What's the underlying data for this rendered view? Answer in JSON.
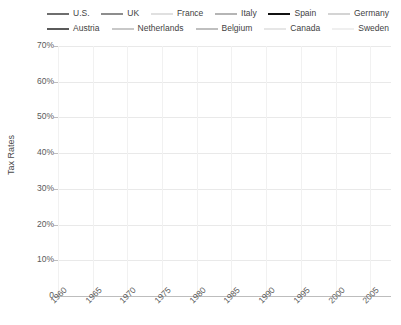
{
  "chart_data": {
    "type": "line",
    "title": "",
    "xlabel": "",
    "ylabel": "Tax Rates",
    "xlim": [
      1960,
      2008
    ],
    "ylim": [
      0,
      70
    ],
    "grid": true,
    "legend_position": "top",
    "ytick_labels": [
      "70%",
      "60%",
      "50%",
      "40%",
      "30%",
      "20%",
      "10%",
      "0"
    ],
    "ytick_values": [
      70,
      60,
      50,
      40,
      30,
      20,
      10,
      0
    ],
    "xtick_labels": [
      "1960",
      "1965",
      "1970",
      "1975",
      "1980",
      "1985",
      "1990",
      "1995",
      "2000",
      "2005"
    ],
    "xtick_values": [
      1960,
      1965,
      1970,
      1975,
      1980,
      1985,
      1990,
      1995,
      2000,
      2005
    ],
    "x": [
      1960,
      1961,
      1962,
      1963,
      1964,
      1965,
      1966,
      1967,
      1968,
      1969,
      1970,
      1971,
      1972,
      1973,
      1974,
      1975,
      1976,
      1977,
      1978,
      1979,
      1980,
      1981,
      1982,
      1983,
      1984,
      1985,
      1986,
      1987,
      1988,
      1989,
      1990,
      1991,
      1992,
      1993,
      1994,
      1995,
      1996,
      1997,
      1998,
      1999,
      2000,
      2001,
      2002,
      2003,
      2004,
      2005,
      2006,
      2007
    ],
    "series": [
      {
        "name": "U.S.",
        "color": "#6e6e6e",
        "width": 2.0,
        "values": [
          26.5,
          26.8,
          26.6,
          26.4,
          25.1,
          24.7,
          25.4,
          25.8,
          27.4,
          28.9,
          27.8,
          26.8,
          27.6,
          27.7,
          28.2,
          26.4,
          27.0,
          27.4,
          27.2,
          27.6,
          27.3,
          27.9,
          27.0,
          25.9,
          25.7,
          26.0,
          25.9,
          27.0,
          26.8,
          27.0,
          27.0,
          27.0,
          26.8,
          27.3,
          27.6,
          27.8,
          28.4,
          28.8,
          29.2,
          29.5,
          29.5,
          28.4,
          26.1,
          25.2,
          25.5,
          26.9,
          27.8,
          27.9
        ]
      },
      {
        "name": "UK",
        "color": "#8d8d8d",
        "width": 2.0,
        "values": [
          28.5,
          28.8,
          29.5,
          28.4,
          28.7,
          30.1,
          31.5,
          33.3,
          34.3,
          36.7,
          37.0,
          35.3,
          34.1,
          33.3,
          35.0,
          35.2,
          35.0,
          34.8,
          33.0,
          33.0,
          35.1,
          36.5,
          38.3,
          37.6,
          37.6,
          37.2,
          37.1,
          36.6,
          36.2,
          35.4,
          35.5,
          34.5,
          33.8,
          32.5,
          33.1,
          34.2,
          34.1,
          34.5,
          35.8,
          36.1,
          36.4,
          35.8,
          34.6,
          34.2,
          34.9,
          35.8,
          36.6,
          36.1
        ]
      },
      {
        "name": "France",
        "color": "#e0e0e0",
        "width": 2.0,
        "values": [
          30.2,
          31.0,
          31.3,
          32.5,
          33.0,
          33.6,
          33.3,
          33.2,
          33.9,
          34.6,
          34.1,
          33.6,
          33.7,
          33.9,
          34.4,
          35.4,
          36.5,
          36.7,
          36.5,
          38.6,
          40.1,
          40.6,
          41.5,
          42.4,
          43.1,
          42.8,
          42.4,
          42.9,
          42.0,
          42.4,
          42.0,
          42.2,
          42.0,
          42.6,
          43.2,
          43.4,
          44.6,
          44.4,
          44.5,
          45.3,
          44.4,
          44.0,
          43.3,
          43.1,
          43.4,
          43.9,
          44.2,
          43.6
        ]
      },
      {
        "name": "Italy",
        "color": "#b5b5b5",
        "width": 2.0,
        "values": [
          25.5,
          26.0,
          26.5,
          26.0,
          26.5,
          26.3,
          26.5,
          26.5,
          27.0,
          26.8,
          26.1,
          26.5,
          26.2,
          24.8,
          25.2,
          25.4,
          25.9,
          27.0,
          28.0,
          28.0,
          29.7,
          30.6,
          32.4,
          34.5,
          33.8,
          33.6,
          34.3,
          35.6,
          36.1,
          37.4,
          37.8,
          38.9,
          41.9,
          45.1,
          41.3,
          40.1,
          42.3,
          43.7,
          42.5,
          42.8,
          42.0,
          41.6,
          41.3,
          41.8,
          40.8,
          40.6,
          42.1,
          43.3
        ]
      },
      {
        "name": "Spain",
        "color": "#111111",
        "width": 2.4,
        "values": [
          14.8,
          15.2,
          15.3,
          15.4,
          15.8,
          14.7,
          15.1,
          16.0,
          16.2,
          16.3,
          16.3,
          16.4,
          17.2,
          18.1,
          18.2,
          18.4,
          18.8,
          20.6,
          21.4,
          22.1,
          22.6,
          23.3,
          23.5,
          25.4,
          25.2,
          26.2,
          28.9,
          30.2,
          30.2,
          31.4,
          32.5,
          32.4,
          33.1,
          32.2,
          32.1,
          31.8,
          31.9,
          32.6,
          32.6,
          33.2,
          33.6,
          33.5,
          33.9,
          33.9,
          34.5,
          35.7,
          36.5,
          37.0
        ]
      },
      {
        "name": "Germany",
        "color": "#d4d4d4",
        "width": 2.0,
        "values": [
          31.0,
          32.0,
          32.4,
          32.9,
          32.3,
          31.7,
          32.2,
          32.7,
          32.5,
          33.6,
          32.3,
          33.2,
          34.1,
          35.6,
          35.3,
          34.8,
          35.4,
          37.0,
          37.1,
          37.2,
          37.5,
          37.2,
          37.2,
          36.7,
          36.8,
          36.9,
          36.5,
          36.7,
          36.2,
          37.4,
          35.2,
          36.4,
          37.5,
          38.0,
          38.0,
          38.0,
          37.8,
          37.1,
          37.1,
          38.0,
          37.9,
          36.4,
          36.1,
          36.3,
          35.5,
          35.5,
          36.0,
          36.5
        ]
      },
      {
        "name": "Austria",
        "color": "#5a5a5a",
        "width": 2.0,
        "values": [
          30.6,
          31.2,
          32.0,
          32.4,
          32.3,
          32.6,
          33.0,
          33.7,
          34.4,
          34.9,
          34.4,
          35.2,
          35.6,
          35.9,
          36.2,
          37.1,
          38.2,
          38.9,
          40.0,
          40.2,
          40.8,
          41.7,
          41.7,
          41.5,
          42.4,
          43.5,
          42.8,
          42.2,
          42.5,
          41.9,
          41.2,
          42.0,
          43.2,
          44.6,
          42.2,
          42.0,
          44.3,
          45.3,
          45.0,
          44.3,
          43.7,
          45.9,
          44.5,
          44.1,
          43.3,
          42.7,
          42.1,
          42.3
        ]
      },
      {
        "name": "Netherlands",
        "color": "#c8c8c8",
        "width": 2.0,
        "values": [
          32.8,
          33.5,
          33.9,
          34.2,
          34.3,
          34.7,
          36.1,
          37.2,
          38.0,
          39.0,
          39.3,
          40.4,
          40.8,
          42.0,
          42.8,
          43.1,
          43.0,
          44.1,
          44.5,
          44.7,
          44.4,
          43.9,
          44.5,
          45.4,
          43.5,
          43.0,
          43.5,
          46.2,
          45.2,
          42.9,
          42.9,
          45.1,
          45.0,
          46.6,
          43.0,
          41.6,
          41.0,
          40.9,
          39.9,
          40.4,
          39.7,
          38.3,
          37.7,
          37.4,
          37.5,
          38.4,
          39.3,
          38.7
        ]
      },
      {
        "name": "Belgium",
        "color": "#bfbfbf",
        "width": 2.0,
        "values": [
          26.5,
          27.0,
          27.4,
          27.7,
          27.6,
          30.0,
          31.1,
          31.8,
          33.0,
          34.0,
          34.5,
          35.4,
          36.1,
          37.1,
          38.5,
          40.5,
          41.1,
          42.3,
          43.2,
          43.1,
          42.4,
          43.0,
          44.1,
          44.9,
          45.3,
          45.6,
          45.0,
          44.4,
          43.1,
          42.4,
          42.0,
          42.6,
          43.3,
          44.1,
          44.8,
          44.1,
          44.5,
          44.4,
          45.0,
          44.7,
          44.9,
          44.8,
          45.1,
          44.6,
          44.6,
          44.6,
          44.0,
          43.6
        ]
      },
      {
        "name": "Canada",
        "color": "#e6e6e6",
        "width": 2.0,
        "values": [
          23.8,
          24.0,
          23.5,
          23.9,
          24.2,
          25.4,
          26.3,
          27.7,
          28.9,
          30.4,
          30.8,
          31.2,
          31.5,
          31.0,
          33.0,
          32.3,
          32.2,
          31.6,
          30.7,
          30.2,
          31.0,
          33.1,
          33.2,
          32.3,
          32.3,
          32.5,
          33.6,
          34.8,
          34.7,
          35.3,
          35.9,
          36.1,
          36.0,
          35.6,
          35.0,
          35.1,
          35.9,
          36.3,
          36.3,
          35.8,
          35.6,
          34.9,
          33.6,
          33.5,
          33.5,
          33.4,
          33.3,
          33.3
        ]
      },
      {
        "name": "Sweden",
        "color": "#efefef",
        "width": 2.0,
        "values": [
          27.2,
          28.4,
          29.6,
          30.9,
          32.0,
          33.3,
          35.0,
          36.4,
          37.6,
          38.0,
          37.8,
          39.6,
          40.5,
          40.2,
          40.6,
          41.3,
          45.0,
          47.1,
          48.0,
          47.2,
          46.4,
          47.4,
          47.0,
          47.8,
          47.4,
          47.7,
          49.6,
          52.6,
          52.2,
          52.5,
          52.2,
          49.3,
          48.0,
          48.0,
          47.8,
          47.5,
          50.1,
          50.6,
          51.5,
          51.6,
          51.4,
          49.4,
          47.5,
          47.8,
          48.1,
          48.9,
          48.3,
          47.4
        ]
      }
    ]
  },
  "legend": {
    "rows": [
      [
        {
          "label": "U.S.",
          "color": "#6e6e6e",
          "width": 2.0,
          "swatch": 22
        },
        {
          "label": "UK",
          "color": "#8d8d8d",
          "width": 2.0,
          "swatch": 22
        },
        {
          "label": "France",
          "color": "#e0e0e0",
          "width": 2.0,
          "swatch": 22
        },
        {
          "label": "Italy",
          "color": "#b5b5b5",
          "width": 2.0,
          "swatch": 22
        },
        {
          "label": "Spain",
          "color": "#111111",
          "width": 2.4,
          "swatch": 22
        },
        {
          "label": "Germany",
          "color": "#d4d4d4",
          "width": 2.0,
          "swatch": 22
        }
      ],
      [
        {
          "label": "Austria",
          "color": "#5a5a5a",
          "width": 2.0,
          "swatch": 22
        },
        {
          "label": "Netherlands",
          "color": "#c8c8c8",
          "width": 2.0,
          "swatch": 22
        },
        {
          "label": "Belgium",
          "color": "#bfbfbf",
          "width": 2.0,
          "swatch": 22
        },
        {
          "label": "Canada",
          "color": "#e6e6e6",
          "width": 2.0,
          "swatch": 22
        },
        {
          "label": "Sweden",
          "color": "#efefef",
          "width": 2.0,
          "swatch": 22
        }
      ]
    ]
  }
}
